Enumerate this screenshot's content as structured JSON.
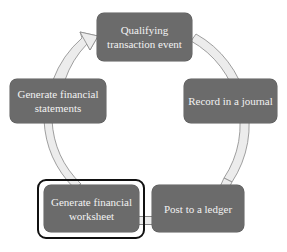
{
  "diagram": {
    "type": "cycle",
    "direction": "clockwise",
    "colors": {
      "node_fill": "#6b6b6b",
      "node_text": "#f2f2f2",
      "arrow_fill": "#ececec",
      "arrow_outline": "#888888",
      "highlight_frame": "#111111"
    },
    "nodes": [
      {
        "id": "qualifying",
        "label": "Qualifying transaction event",
        "line1": "Qualifying",
        "line2": "transaction event"
      },
      {
        "id": "journal",
        "label": "Record in a journal"
      },
      {
        "id": "ledger",
        "label": "Post to a ledger"
      },
      {
        "id": "worksheet",
        "label": "Generate financial worksheet",
        "line1": "Generate financial",
        "line2": "worksheet",
        "highlighted": true
      },
      {
        "id": "statements",
        "label": "Generate financial statements",
        "line1": "Generate financial",
        "line2": "statements"
      }
    ],
    "edges": [
      {
        "from": "qualifying",
        "to": "journal"
      },
      {
        "from": "journal",
        "to": "ledger"
      },
      {
        "from": "ledger",
        "to": "worksheet"
      },
      {
        "from": "worksheet",
        "to": "statements"
      },
      {
        "from": "statements",
        "to": "qualifying"
      }
    ]
  }
}
